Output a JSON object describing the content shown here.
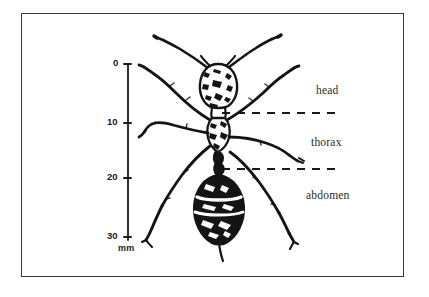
{
  "figure": {
    "background_color": "#ffffff",
    "frame_color": "#3a3a3a",
    "ink_color": "#1a1a1a"
  },
  "scale": {
    "unit_label": "mm",
    "axis_orientation": "vertical",
    "range_mm": [
      0,
      30
    ],
    "ticks": [
      {
        "label": "0",
        "value": 0,
        "y": 64
      },
      {
        "label": "10",
        "value": 10,
        "y": 123
      },
      {
        "label": "20",
        "value": 20,
        "y": 178
      },
      {
        "label": "30",
        "value": 30,
        "y": 237
      }
    ]
  },
  "annotations": {
    "labels": [
      {
        "id": "head",
        "text": "head"
      },
      {
        "id": "thorax",
        "text": "thorax"
      },
      {
        "id": "abdomen",
        "text": "abdomen"
      }
    ],
    "leader_lines": [
      {
        "id": "head-thorax-divider",
        "style": "dashed",
        "y": 113
      },
      {
        "id": "thorax-abdomen-divider",
        "style": "dashed",
        "y": 169
      }
    ]
  },
  "specimen": {
    "name": "ant",
    "view": "dorsal",
    "parts": [
      "antennae",
      "head",
      "thorax",
      "abdomen",
      "legs",
      "sting"
    ]
  }
}
